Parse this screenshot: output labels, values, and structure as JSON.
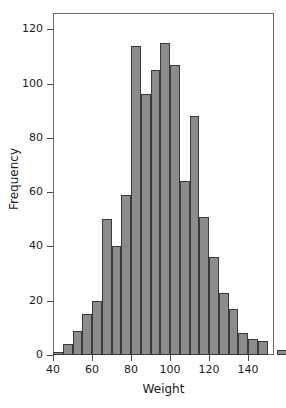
{
  "chart_data": {
    "type": "bar",
    "title": "",
    "subtitle": "",
    "xlabel": "Weight",
    "ylabel": "Frequency",
    "xlim": [
      40,
      145
    ],
    "ylim": [
      0,
      126
    ],
    "grid": false,
    "legend": null,
    "bin_width": 5,
    "xticks": [
      40,
      60,
      80,
      100,
      120,
      140
    ],
    "xtick_labels": [
      "40",
      "60",
      "80",
      "100",
      "120",
      "140"
    ],
    "yticks": [
      0,
      20,
      40,
      60,
      80,
      100,
      120
    ],
    "ytick_labels": [
      "0",
      "20",
      "40",
      "60",
      "80",
      "100",
      "120"
    ],
    "bar_color": "#8c8c8c",
    "bar_edge_color": "#3a3a3a",
    "frame_color": "#6b6b6b",
    "bins": [
      {
        "x0": 40,
        "x1": 45,
        "value": 1
      },
      {
        "x0": 45,
        "x1": 50,
        "value": 4
      },
      {
        "x0": 50,
        "x1": 55,
        "value": 9
      },
      {
        "x0": 55,
        "x1": 60,
        "value": 15
      },
      {
        "x0": 60,
        "x1": 65,
        "value": 20
      },
      {
        "x0": 65,
        "x1": 70,
        "value": 50
      },
      {
        "x0": 70,
        "x1": 75,
        "value": 40
      },
      {
        "x0": 75,
        "x1": 80,
        "value": 59
      },
      {
        "x0": 80,
        "x1": 85,
        "value": 114
      },
      {
        "x0": 85,
        "x1": 90,
        "value": 96
      },
      {
        "x0": 90,
        "x1": 95,
        "value": 105
      },
      {
        "x0": 95,
        "x1": 100,
        "value": 115
      },
      {
        "x0": 100,
        "x1": 105,
        "value": 107
      },
      {
        "x0": 105,
        "x1": 110,
        "value": 64
      },
      {
        "x0": 110,
        "x1": 115,
        "value": 88
      },
      {
        "x0": 115,
        "x1": 120,
        "value": 51
      },
      {
        "x0": 120,
        "x1": 125,
        "value": 36
      },
      {
        "x0": 125,
        "x1": 130,
        "value": 23
      },
      {
        "x0": 130,
        "x1": 135,
        "value": 17
      },
      {
        "x0": 135,
        "x1": 140,
        "value": 8
      },
      {
        "x0": 140,
        "x1": 145,
        "value": 6
      },
      {
        "x0": 145,
        "x1": 150,
        "value": 5
      },
      {
        "x0": 150,
        "x1": 155,
        "value": 0
      },
      {
        "x0": 155,
        "x1": 160,
        "value": 2
      },
      {
        "x0": 160,
        "x1": 165,
        "value": 0
      },
      {
        "x0": 165,
        "x1": 170,
        "value": 0
      },
      {
        "x0": 170,
        "x1": 175,
        "value": 1
      }
    ],
    "categories": [
      "40-45",
      "45-50",
      "50-55",
      "55-60",
      "60-65",
      "65-70",
      "70-75",
      "75-80",
      "80-85",
      "85-90",
      "90-95",
      "95-100",
      "100-105",
      "105-110",
      "110-115",
      "115-120",
      "120-125",
      "125-130",
      "130-135",
      "135-140",
      "140-145",
      "145-150",
      "150-155",
      "155-160",
      "160-165",
      "165-170",
      "170-175"
    ],
    "values": [
      1,
      4,
      9,
      15,
      20,
      50,
      40,
      59,
      114,
      96,
      105,
      115,
      107,
      64,
      88,
      51,
      36,
      23,
      17,
      8,
      6,
      5,
      0,
      2,
      0,
      0,
      1
    ]
  }
}
